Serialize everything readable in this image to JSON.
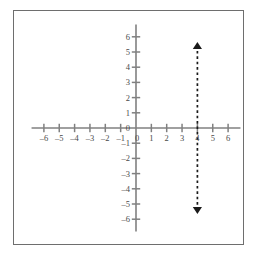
{
  "figure": {
    "title": "",
    "background_color": "#ffffff",
    "frame_color": "#6e6e6e"
  },
  "chart_data": {
    "type": "line",
    "title": "",
    "xlabel": "",
    "ylabel": "",
    "xlim": [
      -7,
      7
    ],
    "ylim": [
      -7,
      7
    ],
    "grid": false,
    "legend": null,
    "axis_color": "#808080",
    "x_ticks": [
      -6,
      -5,
      -4,
      -3,
      -2,
      -1,
      0,
      1,
      2,
      3,
      4,
      5,
      6
    ],
    "x_tick_labels": [
      "–6",
      "–5",
      "–4",
      "–3",
      "–2",
      "–1",
      "0",
      "1",
      "2",
      "3",
      "4",
      "5",
      "6"
    ],
    "y_ticks": [
      6,
      5,
      4,
      3,
      2,
      1,
      0,
      -1,
      -2,
      -3,
      -4,
      -5,
      -6
    ],
    "y_tick_labels": [
      "6",
      "5",
      "4",
      "3",
      "2",
      "1",
      "0",
      "–1",
      "–2",
      "–3",
      "–4",
      "–5",
      "–6"
    ],
    "series": [
      {
        "name": "x = 4",
        "equation": "x = 4",
        "style": "dashed",
        "color": "#1a1a1a",
        "arrow_start": true,
        "arrow_end": true,
        "x": [
          4,
          4
        ],
        "y": [
          -5.4,
          5.4
        ]
      }
    ]
  },
  "axes": {
    "x_axis_label": "",
    "y_axis_label": "",
    "origin_label": "0"
  }
}
